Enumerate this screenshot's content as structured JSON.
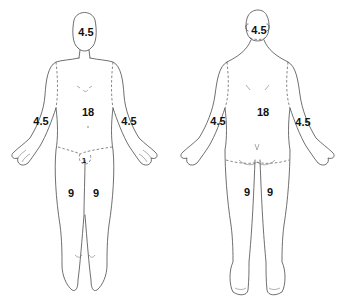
{
  "diagram": {
    "type": "rule-of-nines-body-surface-area",
    "front": {
      "view": "anterior",
      "labels": {
        "head": "4.5",
        "trunk": "18",
        "left_arm": "4.5",
        "right_arm": "4.5",
        "genitals": "1",
        "left_leg": "9",
        "right_leg": "9"
      }
    },
    "back": {
      "view": "posterior",
      "labels": {
        "head": "4.5",
        "trunk": "18",
        "left_arm": "4.5",
        "right_arm": "4.5",
        "left_leg": "9",
        "right_leg": "9"
      }
    },
    "colors": {
      "outline": "#4a4a4a",
      "label": "#111111",
      "background": "#ffffff"
    }
  }
}
